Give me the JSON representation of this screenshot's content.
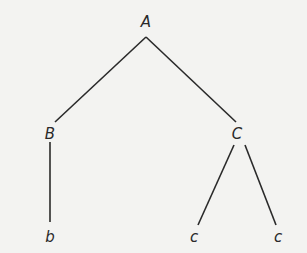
{
  "diagram": {
    "type": "tree",
    "nodes": [
      {
        "id": "A",
        "label": "A",
        "x": 146,
        "y": 22
      },
      {
        "id": "B",
        "label": "B",
        "x": 50,
        "y": 134
      },
      {
        "id": "C",
        "label": "C",
        "x": 237,
        "y": 134
      },
      {
        "id": "b",
        "label": "b",
        "x": 50,
        "y": 237
      },
      {
        "id": "c1",
        "label": "c",
        "x": 194,
        "y": 237
      },
      {
        "id": "c2",
        "label": "c",
        "x": 278,
        "y": 237
      }
    ],
    "edges": [
      {
        "from": "A",
        "to": "B",
        "x1": 146,
        "y1": 37,
        "x2": 55,
        "y2": 122
      },
      {
        "from": "A",
        "to": "C",
        "x1": 146,
        "y1": 37,
        "x2": 236,
        "y2": 122
      },
      {
        "from": "B",
        "to": "b",
        "x1": 50,
        "y1": 142,
        "x2": 50,
        "y2": 222
      },
      {
        "from": "C",
        "to": "c1",
        "x1": 234,
        "y1": 145,
        "x2": 198,
        "y2": 225
      },
      {
        "from": "C",
        "to": "c2",
        "x1": 245,
        "y1": 145,
        "x2": 276,
        "y2": 225
      }
    ],
    "colors": {
      "line": "#2a2a2a",
      "background": "#f3f3f1"
    }
  }
}
